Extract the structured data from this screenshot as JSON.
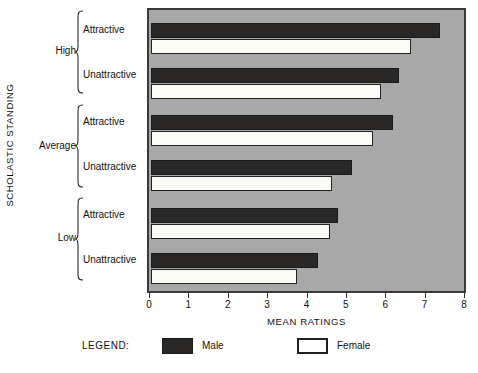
{
  "chart_data": {
    "type": "bar",
    "orientation": "horizontal",
    "title": "",
    "xlabel": "MEAN RATINGS",
    "ylabel": "SCHOLASTIC STANDING",
    "xlim": [
      0,
      8
    ],
    "xticks": [
      0,
      1,
      2,
      3,
      4,
      5,
      6,
      7,
      8
    ],
    "xtick_labels": [
      "0",
      "1",
      "2",
      "3",
      "4",
      "5",
      "6",
      "7",
      "8"
    ],
    "grid": false,
    "legend_position": "bottom",
    "legend_title": "LEGEND:",
    "plot_background": "#a8a8a8",
    "groups": [
      {
        "label": "High",
        "subgroups": [
          {
            "label": "Attractive",
            "male": 7.35,
            "female": 6.6
          },
          {
            "label": "Unattractive",
            "male": 6.3,
            "female": 5.85
          }
        ]
      },
      {
        "label": "Average",
        "subgroups": [
          {
            "label": "Attractive",
            "male": 6.15,
            "female": 5.65
          },
          {
            "label": "Unattractive",
            "male": 5.1,
            "female": 4.6
          }
        ]
      },
      {
        "label": "Low",
        "subgroups": [
          {
            "label": "Attractive",
            "male": 4.75,
            "female": 4.55
          },
          {
            "label": "Unattractive",
            "male": 4.25,
            "female": 3.7
          }
        ]
      }
    ],
    "series": [
      {
        "name": "Male",
        "color": "#2a2826",
        "categories": [
          "High / Attractive",
          "High / Unattractive",
          "Average / Attractive",
          "Average / Unattractive",
          "Low / Attractive",
          "Low / Unattractive"
        ],
        "values": [
          7.35,
          6.3,
          6.15,
          5.1,
          4.75,
          4.25
        ]
      },
      {
        "name": "Female",
        "color": "#ffffff",
        "categories": [
          "High / Attractive",
          "High / Unattractive",
          "Average / Attractive",
          "Average / Unattractive",
          "Low / Attractive",
          "Low / Unattractive"
        ],
        "values": [
          6.6,
          5.85,
          5.65,
          4.6,
          4.55,
          3.7
        ]
      }
    ]
  },
  "legend": {
    "title": "LEGEND:",
    "items": [
      {
        "label": "Male",
        "swatch": "filled-black-swatch"
      },
      {
        "label": "Female",
        "swatch": "outlined-white-swatch"
      }
    ]
  },
  "axes": {
    "x_title": "MEAN RATINGS",
    "y_title": "SCHOLASTIC STANDING",
    "x_tick_labels": [
      "0",
      "1",
      "2",
      "3",
      "4",
      "5",
      "6",
      "7",
      "8"
    ]
  },
  "group_labels": [
    "High",
    "Average",
    "Low"
  ],
  "sub_labels": [
    "Attractive",
    "Unattractive",
    "Attractive",
    "Unattractive",
    "Attractive",
    "Unattractive"
  ]
}
